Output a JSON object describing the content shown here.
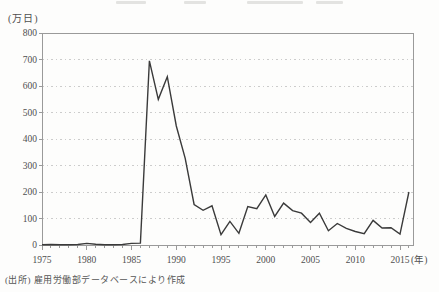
{
  "figure": {
    "unit_label": "(万日)",
    "source_note": "(出所) 雇用労働部データベースにより作成",
    "colors": {
      "line": "#3a3a3a",
      "frame": "#9a9a9a",
      "grid": "#bfbfbf",
      "text": "#4f4f4f",
      "background": "#fdfdfc"
    }
  },
  "chart_data": {
    "type": "line",
    "title": "",
    "xlabel": "(年)",
    "ylabel": "(万日)",
    "ylim": [
      0,
      800
    ],
    "ytick_interval": 100,
    "xticks_labeled": [
      1975,
      1980,
      1985,
      1990,
      1995,
      2000,
      2005,
      2010,
      2015
    ],
    "x_unit_suffix": "(年)",
    "grid": "horizontal-dashed",
    "legend": "none",
    "x": [
      1975,
      1976,
      1977,
      1978,
      1979,
      1980,
      1981,
      1982,
      1983,
      1984,
      1985,
      1986,
      1987,
      1988,
      1989,
      1990,
      1991,
      1992,
      1993,
      1994,
      1995,
      1996,
      1997,
      1998,
      1999,
      2000,
      2001,
      2002,
      2003,
      2004,
      2005,
      2006,
      2007,
      2008,
      2009,
      2010,
      2011,
      2012,
      2013,
      2014,
      2015,
      2016
    ],
    "values": [
      1,
      2,
      1,
      1,
      2,
      6,
      3,
      1,
      1,
      2,
      6,
      7,
      695,
      550,
      635,
      449,
      327,
      153,
      131,
      148,
      39,
      89,
      44,
      145,
      137,
      189,
      108,
      158,
      130,
      120,
      85,
      120,
      54,
      81,
      63,
      51,
      43,
      93,
      64,
      65,
      41,
      200
    ]
  }
}
